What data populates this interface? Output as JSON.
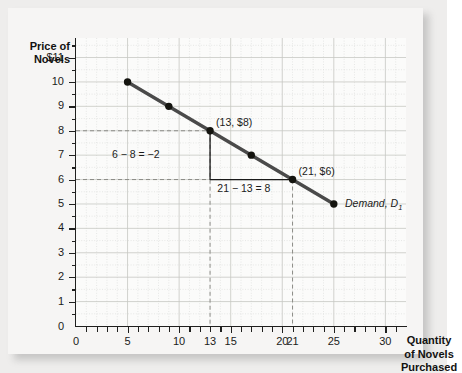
{
  "chart_data": {
    "type": "line",
    "title": "",
    "xlabel": "Quantity of Novels Purchased",
    "ylabel": "Price of Novels",
    "xlim": [
      0,
      32
    ],
    "ylim": [
      0,
      11.8
    ],
    "grid": true,
    "legend_position": "inline-right",
    "series": [
      {
        "name": "Demand, D1",
        "x": [
          5,
          9,
          13,
          17,
          21,
          25
        ],
        "y": [
          10,
          9,
          8,
          7,
          6,
          5
        ],
        "color": "#4a4a4a",
        "marker": "filled-circle",
        "marker_color": "#14140f"
      }
    ],
    "x_tick_values": [
      0,
      5,
      10,
      13,
      15,
      20,
      21,
      25,
      30
    ],
    "x_tick_labels": [
      "0",
      "5",
      "10",
      "13",
      "15",
      "20",
      "21",
      "25",
      "30"
    ],
    "y_tick_values": [
      1,
      2,
      3,
      4,
      5,
      6,
      7,
      8,
      9,
      10,
      11
    ],
    "y_tick_labels": [
      "1",
      "2",
      "3",
      "4",
      "5",
      "6",
      "7",
      "8",
      "9",
      "10",
      "$11"
    ],
    "y_origin_label": "0",
    "annotations": [
      {
        "id": "point-label-a",
        "text": "(13, $8)",
        "x": 13,
        "y": 8
      },
      {
        "id": "point-label-b",
        "text": "(21, $6)",
        "x": 21,
        "y": 6
      },
      {
        "id": "rise-label",
        "text": "6 − 8 = −2",
        "x": 9.5,
        "y": 7
      },
      {
        "id": "run-label",
        "text": "21 − 13 = 8",
        "x": 17,
        "y": 5.6
      },
      {
        "id": "curve-label",
        "text": "Demand, D",
        "subscript": "1",
        "x": 25.6,
        "y": 5
      }
    ],
    "guide_lines": {
      "horizontal": [
        {
          "from_axis_to_x": 13,
          "y": 8
        },
        {
          "from_axis_to_x": 21,
          "y": 6
        }
      ],
      "vertical": [
        {
          "x": 13,
          "from_y": 8,
          "to_axis": true
        },
        {
          "x": 21,
          "from_y": 6,
          "to_axis": true
        }
      ]
    },
    "slope_triangle": {
      "vertical_leg": {
        "x": 13,
        "y_from": 8,
        "y_to": 6
      },
      "horizontal_leg": {
        "y": 6,
        "x_from": 13,
        "x_to": 21
      },
      "color": "#1a1a1a"
    },
    "colors": {
      "curve": "#4a4a4a",
      "marker": "#14140f",
      "grid_minor": "#d9dad6",
      "grid_major": "#c6c8c3",
      "axis": "#20201f",
      "dashed_guide": "#8b8b86",
      "background": "#fbfbfa",
      "card_background": "#f6f5f4",
      "page_background": "#eeedec"
    }
  }
}
